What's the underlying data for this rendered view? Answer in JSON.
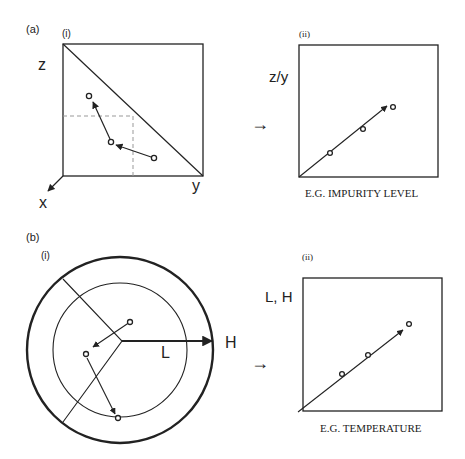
{
  "figure": {
    "panel_a": {
      "label": "(a)",
      "sub_i": {
        "label": "(i)",
        "axis_z": "z",
        "axis_y": "y",
        "axis_x": "x",
        "points": [
          [
            89,
            96
          ],
          [
            111,
            142
          ],
          [
            154,
            158
          ]
        ]
      },
      "transition_arrow": "→",
      "sub_ii": {
        "label": "(ii)",
        "y_axis_label": "z/y",
        "x_axis_caption": "E.G. IMPURITY LEVEL",
        "points": [
          [
            330,
            153
          ],
          [
            363,
            129
          ],
          [
            392,
            107
          ]
        ]
      }
    },
    "panel_b": {
      "label": "(b)",
      "sub_i": {
        "label": "(i)",
        "radius_low_label": "L",
        "radius_high_label": "H",
        "points": [
          [
            130,
            322
          ],
          [
            86,
            354
          ],
          [
            118,
            418
          ]
        ]
      },
      "transition_arrow": "→",
      "sub_ii": {
        "label": "(ii)",
        "y_axis_label": "L, H",
        "x_axis_caption": "E.G. TEMPERATURE",
        "points": [
          [
            342,
            374
          ],
          [
            368,
            355
          ],
          [
            408,
            324
          ]
        ]
      }
    }
  },
  "colors": {
    "stroke": "#222222",
    "dashed": "#999999",
    "background": "#ffffff"
  }
}
